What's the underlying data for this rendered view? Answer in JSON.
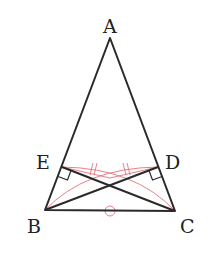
{
  "diagram": {
    "type": "geometry-figure",
    "colors": {
      "main_line": "#2a2a2a",
      "construction": "#e8707a",
      "label": "#222222"
    },
    "points": {
      "A": {
        "label": "A",
        "x": 110,
        "y": 38
      },
      "B": {
        "label": "B",
        "x": 45,
        "y": 210
      },
      "C": {
        "label": "C",
        "x": 175,
        "y": 211
      },
      "D": {
        "label": "D",
        "x": 158,
        "y": 167
      },
      "E": {
        "label": "E",
        "x": 62,
        "y": 167
      }
    },
    "labels": {
      "A": "A",
      "B": "B",
      "C": "C",
      "D": "D",
      "E": "E"
    },
    "segments": [
      "AB",
      "AC",
      "BC",
      "BD",
      "CE"
    ],
    "marks": {
      "right_angle_at_E": "CE ⊥ AB",
      "right_angle_at_D": "BD ⊥ AC",
      "equal_tick_marks": "double tick (//) on two red segments",
      "circle_mark_on_BC": "common side BC"
    }
  }
}
